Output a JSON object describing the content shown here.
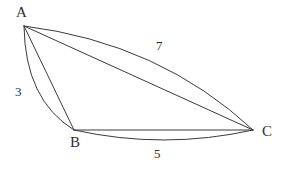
{
  "figure": {
    "type": "geometry-diagram",
    "background_color": "#ffffff",
    "stroke_color": "#3a3a3c",
    "text_color": "#2e2e30",
    "canvas": {
      "width": 286,
      "height": 170
    },
    "vertices": [
      {
        "id": "A",
        "label": "A",
        "x": 24,
        "y": 26,
        "label_x": 16,
        "label_y": 5
      },
      {
        "id": "B",
        "label": "B",
        "x": 74,
        "y": 130,
        "label_x": 70,
        "label_y": 135
      },
      {
        "id": "C",
        "label": "C",
        "x": 253,
        "y": 130,
        "label_x": 262,
        "label_y": 124
      }
    ],
    "straight_edges": [
      {
        "id": "AB",
        "from": "A",
        "to": "B",
        "path": "M 24 26 L 74 130"
      },
      {
        "id": "AC",
        "from": "A",
        "to": "C",
        "path": "M 24 26 L 253 130"
      },
      {
        "id": "BC",
        "from": "B",
        "to": "C",
        "path": "M 74 130 L 253 130"
      }
    ],
    "arcs": [
      {
        "id": "arc-AC",
        "from": "A",
        "to": "C",
        "bulge": "up-right",
        "path": "M 24 26 Q 160 43 253 130"
      },
      {
        "id": "arc-AB",
        "from": "A",
        "to": "B",
        "bulge": "left",
        "path": "M 24 26 Q 25 100 74 130"
      },
      {
        "id": "arc-BC",
        "from": "B",
        "to": "C",
        "bulge": "down",
        "path": "M 74 130 Q 164 150 253 130"
      }
    ],
    "length_labels": [
      {
        "id": "len-AC",
        "edge": "AC",
        "value": "7",
        "x": 156,
        "y": 39
      },
      {
        "id": "len-AB",
        "edge": "AB",
        "value": "3",
        "x": 15,
        "y": 85
      },
      {
        "id": "len-BC",
        "edge": "BC",
        "value": "5",
        "x": 154,
        "y": 147
      }
    ]
  }
}
